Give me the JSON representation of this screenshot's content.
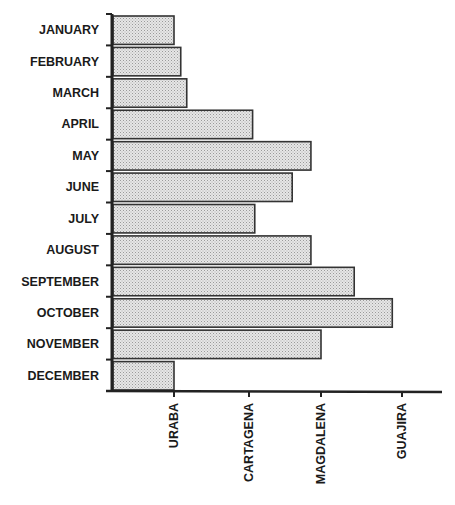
{
  "chart_data": {
    "type": "bar",
    "orientation": "horizontal",
    "title": "",
    "xlabel": "",
    "ylabel": "",
    "categories": [
      "JANUARY",
      "FEBRUARY",
      "MARCH",
      "APRIL",
      "MAY",
      "JUNE",
      "JULY",
      "AUGUST",
      "SEPTEMBER",
      "OCTOBER",
      "NOVEMBER",
      "DECEMBER"
    ],
    "x_tick_labels": [
      "URABA",
      "CARTAGENA",
      "MAGDALENA",
      "GUAJIRA"
    ],
    "x_tick_positions": [
      1,
      2,
      3,
      4
    ],
    "xlim": [
      0,
      4.5
    ],
    "values": [
      1.0,
      1.09,
      1.17,
      2.05,
      2.86,
      2.6,
      2.08,
      2.86,
      3.41,
      3.88,
      3.0,
      1.0
    ],
    "grid": false,
    "legend": null,
    "bar_fill": "#d4d4d4",
    "bar_edge": "#333333"
  },
  "layout": {
    "axis_x0": 112,
    "axis_top": 14,
    "axis_bottom": 391,
    "axis_right": 442,
    "tick_px": [
      174,
      249,
      321,
      402
    ]
  }
}
